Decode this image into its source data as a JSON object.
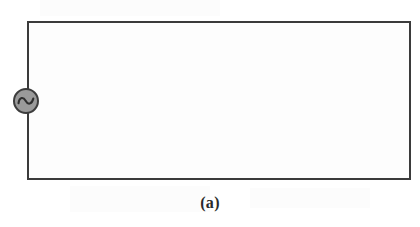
{
  "figure": {
    "caption": "(a)",
    "type": "circuit-diagram",
    "background_color": "#ffffff",
    "wire_color": "#3b3b3b",
    "loop_fill_color": "#fdfdfd"
  },
  "circuit": {
    "topology": "single closed rectangular loop",
    "wire_label": "",
    "components": [
      {
        "name": "ac-voltage-source",
        "symbol": "sine-wave-in-circle",
        "label": "",
        "position": "left-branch",
        "fill_color": "#9a9a9a",
        "outline_color": "#3d3d3d",
        "diameter_px": 26
      }
    ],
    "segments": [
      {
        "name": "top-wire",
        "orientation": "horizontal"
      },
      {
        "name": "right-wire",
        "orientation": "vertical"
      },
      {
        "name": "bottom-wire",
        "orientation": "horizontal"
      },
      {
        "name": "left-wire",
        "orientation": "vertical"
      }
    ]
  }
}
